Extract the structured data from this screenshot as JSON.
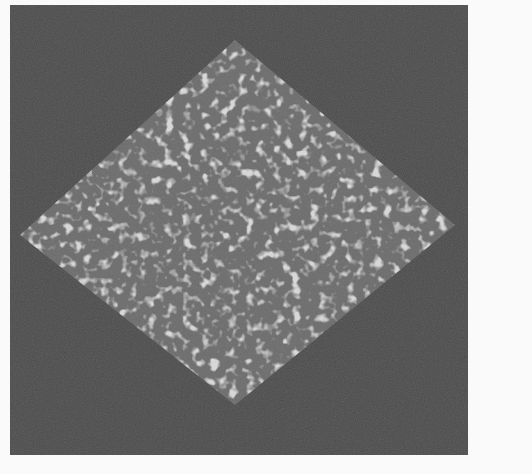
{
  "image": {
    "description": "Grayscale noisy micrograph showing a bright speckled diamond-shaped region on a dark noisy background",
    "background_color": "#fafafa",
    "panel": {
      "x": 10,
      "y": 5,
      "width": 458,
      "height": 450,
      "color": "#4b4b4b"
    },
    "diamond": {
      "top": [
        225,
        35
      ],
      "right": [
        445,
        220
      ],
      "bottom": [
        225,
        400
      ],
      "left": [
        10,
        230
      ],
      "fill_color": "#6c6c6c",
      "speckle_color_light": "#c8c8c8",
      "speckle_color_mid": "#9a9a9a"
    }
  }
}
